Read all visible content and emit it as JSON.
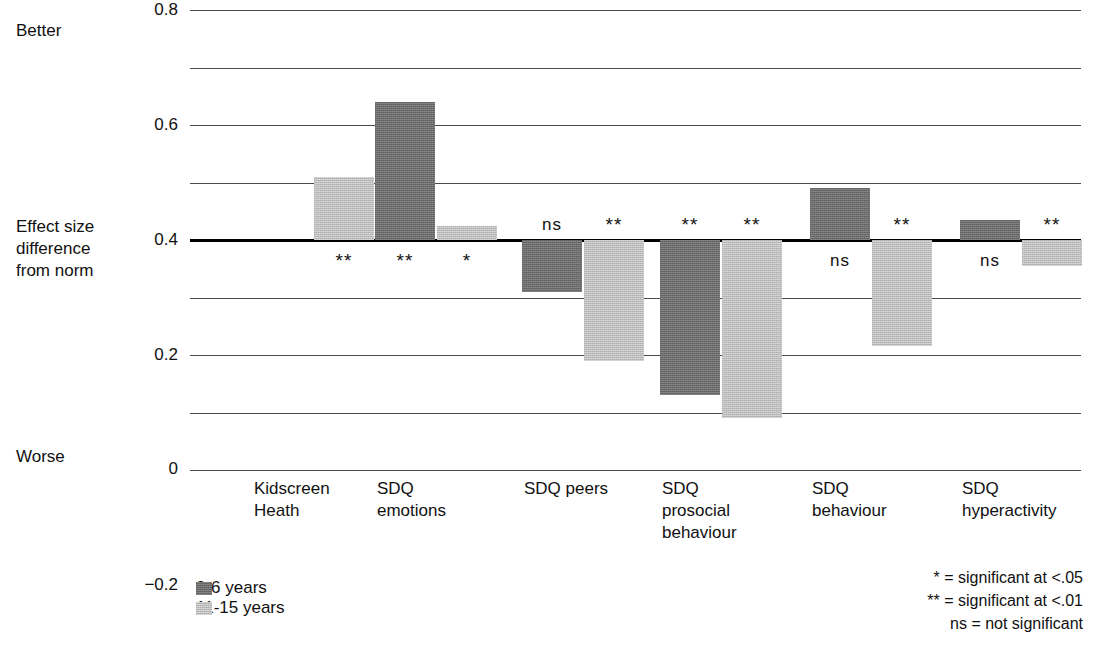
{
  "annotations": {
    "better": "Better",
    "worse": "Worse",
    "axis_title_lines": [
      "Effect size",
      "difference",
      "from norm"
    ]
  },
  "legend": {
    "items": [
      {
        "label": "3-6 years",
        "color": "#6b6b6b",
        "key": "dark"
      },
      {
        "label": "11-15 years",
        "color": "#bcbcbc",
        "key": "light"
      }
    ]
  },
  "significance_key": {
    "lines": [
      "* = significant at <.05",
      "** = significant at <.01",
      "ns = not significant"
    ]
  },
  "chart_data": {
    "type": "bar",
    "title": "",
    "xlabel": "",
    "ylabel": "Effect size difference from norm",
    "ylim": [
      -0.8,
      0.8
    ],
    "ytick_labels": [
      "0.8",
      "0.6",
      "0.4",
      "0.2",
      "0",
      "−0.2",
      "−0.4",
      "−0.6",
      "−0.8"
    ],
    "ytick_values": [
      0.8,
      0.6,
      0.4,
      0.2,
      0,
      -0.2,
      -0.4,
      -0.6,
      -0.8
    ],
    "grid": true,
    "legend_position": "bottom-left",
    "categories": [
      "Kidscreen\nHeath",
      "SDQ\nemotions",
      "SDQ peers",
      "SDQ\nprosocial\nbehaviour",
      "SDQ\nbehaviour",
      "SDQ\nhyperactivity"
    ],
    "series": [
      {
        "name": "3-6 years",
        "color": "#6b6b6b",
        "values": [
          null,
          0.48,
          -0.18,
          -0.54,
          0.18,
          0.07
        ],
        "significance": [
          null,
          "**",
          "ns",
          "**",
          "ns",
          "ns"
        ]
      },
      {
        "name": "11-15 years",
        "color": "#bcbcbc",
        "values": [
          0.22,
          0.05,
          -0.42,
          -0.62,
          -0.37,
          -0.09
        ],
        "significance": [
          "**",
          "*",
          "**",
          "**",
          "**",
          "**"
        ]
      }
    ]
  }
}
